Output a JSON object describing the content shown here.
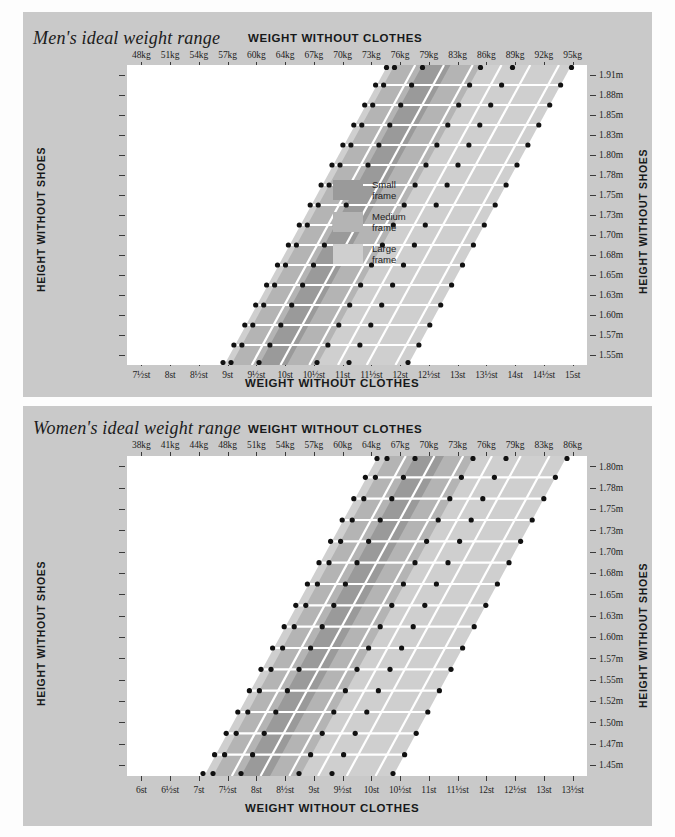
{
  "charts": [
    {
      "id": "men",
      "title": "Men's ideal weight range",
      "top_axis_title": "WEIGHT WITHOUT CLOTHES",
      "bottom_axis_title": "WEIGHT WITHOUT CLOTHES",
      "left_axis_title": "HEIGHT WITHOUT SHOES",
      "right_axis_title": "HEIGHT WITHOUT SHOES",
      "top_ticks": [
        "48kg",
        "51kg",
        "54kg",
        "57kg",
        "60kg",
        "64kg",
        "67kg",
        "70kg",
        "73kg",
        "76kg",
        "79kg",
        "83kg",
        "86kg",
        "89kg",
        "92kg",
        "95kg"
      ],
      "bottom_ticks": [
        "7½st",
        "8st",
        "8½st",
        "9st",
        "9½st",
        "10st",
        "10½st",
        "11st",
        "11½st",
        "12st",
        "12½st",
        "13st",
        "13½st",
        "14st",
        "14½st",
        "15st"
      ],
      "left_ticks": [
        "6'3\"",
        "6'2\"",
        "6'1\"",
        "6'0\"",
        "5'11\"",
        "5'10\"",
        "5'9\"",
        "5'8\"",
        "5'7\"",
        "5'6\"",
        "5'5\"",
        "5'4\"",
        "5'3\"",
        "5'2\"",
        "5'1\""
      ],
      "right_ticks": [
        "1.91m",
        "1.88m",
        "1.85m",
        "1.83m",
        "1.80m",
        "1.78m",
        "1.75m",
        "1.73m",
        "1.70m",
        "1.68m",
        "1.65m",
        "1.63m",
        "1.60m",
        "1.57m",
        "1.55m"
      ]
    },
    {
      "id": "women",
      "title": "Women's ideal weight range",
      "top_axis_title": "WEIGHT WITHOUT CLOTHES",
      "bottom_axis_title": "WEIGHT WITHOUT CLOTHES",
      "left_axis_title": "HEIGHT WITHOUT SHOES",
      "right_axis_title": "HEIGHT WITHOUT SHOES",
      "top_ticks": [
        "38kg",
        "41kg",
        "44kg",
        "48kg",
        "51kg",
        "54kg",
        "57kg",
        "60kg",
        "64kg",
        "67kg",
        "70kg",
        "73kg",
        "76kg",
        "79kg",
        "83kg",
        "86kg"
      ],
      "bottom_ticks": [
        "6st",
        "6½st",
        "7st",
        "7½st",
        "8st",
        "8½st",
        "9st",
        "9½st",
        "10st",
        "10½st",
        "11st",
        "11½st",
        "12st",
        "12½st",
        "13st",
        "13½st"
      ],
      "left_ticks": [
        "5'11\"",
        "5'10\"",
        "5'9\"",
        "5'8\"",
        "5'7\"",
        "5'6\"",
        "5'5\"",
        "5'4\"",
        "5'3\"",
        "5'2\"",
        "5'1\"",
        "5'0\"",
        "4'11\"",
        "4'10\"",
        "4'9\""
      ],
      "right_ticks": [
        "1.80m",
        "1.78m",
        "1.75m",
        "1.73m",
        "1.70m",
        "1.68m",
        "1.65m",
        "1.63m",
        "1.60m",
        "1.57m",
        "1.55m",
        "1.52m",
        "1.50m",
        "1.47m",
        "1.45m"
      ]
    }
  ],
  "legend": {
    "items": [
      {
        "label_line1": "Small",
        "label_line2": "frame",
        "color": "#9a9a9a"
      },
      {
        "label_line1": "Medium",
        "label_line2": "frame",
        "color": "#b4b4b4"
      },
      {
        "label_line1": "Large",
        "label_line2": "frame",
        "color": "#cfcfcf"
      }
    ]
  },
  "colors": {
    "panel_bg": "#c9c9c9",
    "plot_bg": "#ffffff",
    "small_frame": "#9a9a9a",
    "medium_frame": "#b4b4b4",
    "large_frame": "#cfcfcf",
    "grid": "#ffffff",
    "dot": "#111111",
    "text": "#1d1d1d"
  },
  "chart_data": {
    "type": "area",
    "xlabel": "WEIGHT WITHOUT CLOTHES",
    "ylabel": "HEIGHT WITHOUT SHOES",
    "grid": true,
    "legend_position": "inside-right",
    "panels": [
      {
        "name": "Men's ideal weight range",
        "x_axis_top_units": "kg",
        "x_axis_bottom_units": "stones",
        "y_axis_left_units": "feet-inches",
        "y_axis_right_units": "metres",
        "x_top": [
          48,
          51,
          54,
          57,
          60,
          64,
          67,
          70,
          73,
          76,
          79,
          83,
          86,
          89,
          92,
          95
        ],
        "x_bottom": [
          7.5,
          8,
          8.5,
          9,
          9.5,
          10,
          10.5,
          11,
          11.5,
          12,
          12.5,
          13,
          13.5,
          14,
          14.5,
          15
        ],
        "y_left": [
          "6'3\"",
          "6'2\"",
          "6'1\"",
          "6'0\"",
          "5'11\"",
          "5'10\"",
          "5'9\"",
          "5'8\"",
          "5'7\"",
          "5'6\"",
          "5'5\"",
          "5'4\"",
          "5'3\"",
          "5'2\"",
          "5'1\""
        ],
        "y_right": [
          1.91,
          1.88,
          1.85,
          1.83,
          1.8,
          1.78,
          1.75,
          1.73,
          1.7,
          1.68,
          1.65,
          1.63,
          1.6,
          1.57,
          1.55
        ],
        "series": [
          {
            "name": "Small frame",
            "band_kg_low": [
              70,
              68,
              66,
              64,
              63,
              61,
              60,
              58,
              57,
              56,
              54,
              53,
              52,
              51,
              50
            ],
            "band_kg_high": [
              76,
              74,
              72,
              70,
              68,
              67,
              65,
              63,
              62,
              60,
              59,
              58,
              56,
              55,
              54
            ]
          },
          {
            "name": "Medium frame",
            "band_kg_low": [
              74,
              72,
              70,
              68,
              67,
              65,
              63,
              62,
              60,
              59,
              57,
              56,
              55,
              54,
              53
            ],
            "band_kg_high": [
              83,
              81,
              79,
              77,
              75,
              73,
              71,
              69,
              67,
              66,
              64,
              63,
              61,
              60,
              59
            ]
          },
          {
            "name": "Large frame",
            "band_kg_low": [
              80,
              78,
              76,
              74,
              72,
              70,
              68,
              66,
              65,
              63,
              62,
              60,
              59,
              58,
              57
            ],
            "band_kg_high": [
              92,
              90,
              87,
              85,
              83,
              81,
              79,
              77,
              75,
              73,
              71,
              69,
              68,
              66,
              65
            ]
          }
        ]
      },
      {
        "name": "Women's ideal weight range",
        "x_axis_top_units": "kg",
        "x_axis_bottom_units": "stones",
        "y_axis_left_units": "feet-inches",
        "y_axis_right_units": "metres",
        "x_top": [
          38,
          41,
          44,
          48,
          51,
          54,
          57,
          60,
          64,
          67,
          70,
          73,
          76,
          79,
          83,
          86
        ],
        "x_bottom": [
          6,
          6.5,
          7,
          7.5,
          8,
          8.5,
          9,
          9.5,
          10,
          10.5,
          11,
          11.5,
          12,
          12.5,
          13,
          13.5
        ],
        "y_left": [
          "5'11\"",
          "5'10\"",
          "5'9\"",
          "5'8\"",
          "5'7\"",
          "5'6\"",
          "5'5\"",
          "5'4\"",
          "5'3\"",
          "5'2\"",
          "5'1\"",
          "5'0\"",
          "4'11\"",
          "4'10\"",
          "4'9\""
        ],
        "y_right": [
          1.8,
          1.78,
          1.75,
          1.73,
          1.7,
          1.68,
          1.65,
          1.63,
          1.6,
          1.57,
          1.55,
          1.52,
          1.5,
          1.47,
          1.45
        ],
        "series": [
          {
            "name": "Small frame",
            "band_kg_low": [
              59,
              58,
              56,
              55,
              54,
              52,
              51,
              50,
              49,
              48,
              47,
              46,
              45,
              44,
              43
            ],
            "band_kg_high": [
              65,
              63,
              61,
              60,
              58,
              57,
              55,
              54,
              53,
              52,
              51,
              50,
              49,
              48,
              47
            ]
          },
          {
            "name": "Medium frame",
            "band_kg_low": [
              63,
              62,
              60,
              58,
              57,
              55,
              54,
              53,
              51,
              50,
              49,
              48,
              47,
              46,
              45
            ],
            "band_kg_high": [
              71,
              69,
              67,
              65,
              64,
              62,
              60,
              59,
              57,
              56,
              55,
              54,
              53,
              52,
              51
            ]
          },
          {
            "name": "Large frame",
            "band_kg_low": [
              68,
              67,
              65,
              63,
              62,
              60,
              58,
              57,
              56,
              54,
              53,
              52,
              51,
              50,
              49
            ],
            "band_kg_high": [
              80,
              78,
              76,
              74,
              72,
              70,
              68,
              66,
              65,
              63,
              62,
              60,
              59,
              58,
              57
            ]
          }
        ]
      }
    ]
  }
}
